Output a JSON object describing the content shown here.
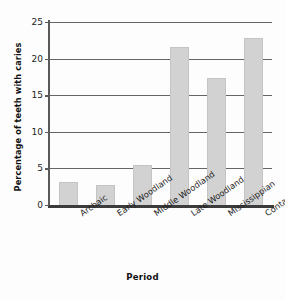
{
  "chart_data": {
    "type": "bar",
    "title": "",
    "xlabel": "Period",
    "ylabel": "Percentage of teeth with caries",
    "categories": [
      "Archaic",
      "Early Woodland",
      "Middle Woodland",
      "Late Woodland",
      "Mississippian",
      "Contact"
    ],
    "values": [
      3.2,
      2.8,
      5.4,
      21.6,
      17.3,
      22.8
    ],
    "ylim": [
      0,
      25
    ],
    "yticks": [
      0,
      5,
      10,
      15,
      20,
      25
    ],
    "ytick_labels": [
      "0",
      "5",
      "10",
      "15",
      "20",
      "25"
    ],
    "grid": true,
    "grid_axis": "y",
    "legend": false,
    "bar_color": "#d2d2d2",
    "bar_edge_color": "#c4c4c4",
    "axis_color": "#3c3c3c",
    "background_color": "#fdfdfd"
  }
}
